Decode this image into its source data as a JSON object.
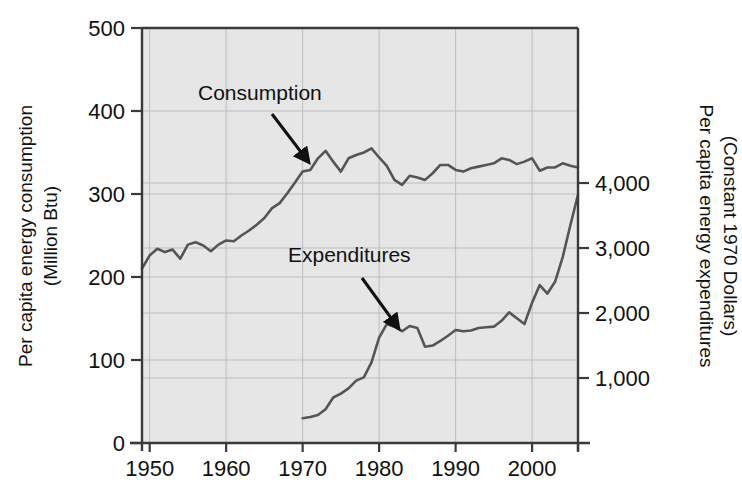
{
  "chart_data": {
    "type": "line",
    "title": "",
    "plot_background": "#e6e6e6",
    "grid": true,
    "grid_color": "#bdbdbd",
    "axis_color": "#3a3a3a",
    "line_color": "#555555",
    "legend": "inline-annotations",
    "xlabel": "",
    "x_tick_labels": [
      "1950",
      "1960",
      "1970",
      "1980",
      "1990",
      "2000"
    ],
    "x_ticks": [
      1950,
      1960,
      1970,
      1980,
      1990,
      2000
    ],
    "xlim": [
      1949,
      2006
    ],
    "left_axis": {
      "label_line1": "Per capita energy consumption",
      "label_line2": "(Million Btu)",
      "tick_labels": [
        "0",
        "100",
        "200",
        "300",
        "400",
        "500"
      ],
      "ticks": [
        0,
        100,
        200,
        300,
        400,
        500
      ],
      "ylim": [
        0,
        500
      ],
      "unit": "Million Btu"
    },
    "right_axis": {
      "label_line1": "Per capita energy expenditures",
      "label_line2": "(Constant 1970 Dollars)",
      "tick_labels": [
        "1,000",
        "2,000",
        "3,000",
        "4,000"
      ],
      "ticks": [
        1000,
        2000,
        3000,
        4000
      ],
      "ylim": [
        0,
        6385
      ],
      "unit": "Constant 1970 Dollars"
    },
    "annotations": [
      {
        "name": "consumption",
        "text": "Consumption",
        "text_x": 198,
        "text_y": 100,
        "arrow_from": [
          272,
          114
        ],
        "arrow_to": [
          304,
          156
        ]
      },
      {
        "name": "expenditures",
        "text": "Expenditures",
        "text_x": 288,
        "text_y": 262,
        "arrow_from": [
          362,
          278
        ],
        "arrow_to": [
          394,
          322
        ]
      }
    ],
    "series": [
      {
        "name": "Consumption",
        "axis": "left",
        "unit": "Million Btu",
        "x": [
          1949,
          1950,
          1951,
          1952,
          1953,
          1954,
          1955,
          1956,
          1957,
          1958,
          1959,
          1960,
          1961,
          1962,
          1963,
          1964,
          1965,
          1966,
          1967,
          1968,
          1969,
          1970,
          1971,
          1972,
          1973,
          1974,
          1975,
          1976,
          1977,
          1978,
          1979,
          1980,
          1981,
          1982,
          1983,
          1984,
          1985,
          1986,
          1987,
          1988,
          1989,
          1990,
          1991,
          1992,
          1993,
          1994,
          1995,
          1996,
          1997,
          1998,
          1999,
          2000,
          2001,
          2002,
          2003,
          2004,
          2005,
          2006
        ],
        "values": [
          210,
          226,
          234,
          230,
          233,
          222,
          239,
          242,
          238,
          231,
          239,
          244,
          243,
          250,
          256,
          263,
          271,
          283,
          289,
          301,
          314,
          327,
          329,
          343,
          352,
          339,
          327,
          343,
          347,
          350,
          355,
          344,
          334,
          317,
          311,
          322,
          320,
          317,
          325,
          335,
          335,
          329,
          327,
          331,
          333,
          335,
          337,
          343,
          341,
          336,
          339,
          343,
          328,
          332,
          332,
          337,
          334,
          332
        ]
      },
      {
        "name": "Expenditures",
        "axis": "right",
        "unit": "Constant 1970 Dollars",
        "x": [
          1970,
          1971,
          1972,
          1973,
          1974,
          1975,
          1976,
          1977,
          1978,
          1979,
          1980,
          1981,
          1982,
          1983,
          1984,
          1985,
          1986,
          1987,
          1988,
          1989,
          1990,
          1991,
          1992,
          1993,
          1994,
          1995,
          1996,
          1997,
          1998,
          1999,
          2000,
          2001,
          2002,
          2003,
          2004,
          2005,
          2006
        ],
        "values": [
          380,
          400,
          430,
          520,
          700,
          760,
          840,
          960,
          1010,
          1240,
          1620,
          1830,
          1790,
          1720,
          1800,
          1770,
          1480,
          1500,
          1570,
          1650,
          1740,
          1720,
          1730,
          1770,
          1780,
          1790,
          1880,
          2010,
          1920,
          1830,
          2160,
          2430,
          2300,
          2480,
          2860,
          3350,
          3820
        ]
      }
    ]
  },
  "figure": {
    "plot_left_px": 142,
    "plot_right_px": 578,
    "plot_top_px": 28,
    "plot_bottom_px": 443
  }
}
